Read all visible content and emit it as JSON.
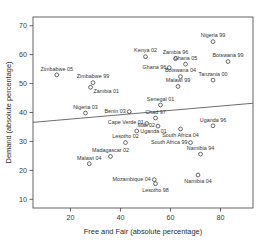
{
  "chart_data": {
    "type": "scatter",
    "title": "",
    "xlabel": "Free and Fair (absolute percentage)",
    "ylabel": "Demand (absolute percentage)",
    "xlim": [
      5,
      93
    ],
    "ylim": [
      7,
      73
    ],
    "xticks": [
      20,
      40,
      60,
      80
    ],
    "yticks": [
      10,
      20,
      30,
      40,
      50,
      60,
      70
    ],
    "grid": false,
    "legend": "none",
    "marker": "open-circle",
    "fit_line": {
      "label": "linear-fit",
      "x": [
        5,
        93
      ],
      "y": [
        36.6,
        43.2
      ]
    },
    "points": [
      {
        "label": "Zimbabwe 05",
        "x": 14.5,
        "y": 53.0,
        "lpos": "above"
      },
      {
        "label": "Zimbabwe 99",
        "x": 29.0,
        "y": 50.3,
        "lpos": "above"
      },
      {
        "label": "Zambia 01",
        "x": 28.0,
        "y": 48.7,
        "lpos": "below-right"
      },
      {
        "label": "Kenya 02",
        "x": 50.0,
        "y": 59.3,
        "lpos": "above"
      },
      {
        "label": "Zambia 96",
        "x": 62.0,
        "y": 58.6,
        "lpos": "above"
      },
      {
        "label": "Ghana 05",
        "x": 66.0,
        "y": 56.7,
        "lpos": "above"
      },
      {
        "label": "Nigeria 99",
        "x": 77.0,
        "y": 64.5,
        "lpos": "above"
      },
      {
        "label": "Botswana 99",
        "x": 83.0,
        "y": 57.6,
        "lpos": "above"
      },
      {
        "label": "Ghana 96",
        "x": 59.5,
        "y": 55.5,
        "lpos": "below-left"
      },
      {
        "label": "Botswana 04",
        "x": 64.0,
        "y": 52.4,
        "lpos": "above"
      },
      {
        "label": "Tanzania 00",
        "x": 77.0,
        "y": 51.2,
        "lpos": "above"
      },
      {
        "label": "Malawi 99",
        "x": 63.0,
        "y": 49.0,
        "lpos": "above"
      },
      {
        "label": "Senegal 01",
        "x": 56.0,
        "y": 42.6,
        "lpos": "above"
      },
      {
        "label": "Nigeria 03",
        "x": 26.0,
        "y": 39.8,
        "lpos": "above"
      },
      {
        "label": "Benin 03",
        "x": 43.5,
        "y": 40.3,
        "lpos": "left"
      },
      {
        "label": "Chad 97",
        "x": 54.0,
        "y": 38.1,
        "lpos": "above"
      },
      {
        "label": "Cape Verde 01",
        "x": 50.5,
        "y": 36.2,
        "lpos": "below-left"
      },
      {
        "label": "Mali 02",
        "x": 55.0,
        "y": 35.3,
        "lpos": "below-left"
      },
      {
        "label": "Uganda 96",
        "x": 77.0,
        "y": 35.4,
        "lpos": "above"
      },
      {
        "label": "Uganda 01",
        "x": 46.5,
        "y": 33.6,
        "lpos": "right"
      },
      {
        "label": "South Africa 04",
        "x": 64.0,
        "y": 34.3,
        "lpos": "below"
      },
      {
        "label": "South Africa 99",
        "x": 68.0,
        "y": 29.6,
        "lpos": "below-left"
      },
      {
        "label": "Lesotho 02",
        "x": 42.0,
        "y": 29.6,
        "lpos": "above"
      },
      {
        "label": "Namibia 94",
        "x": 72.0,
        "y": 25.6,
        "lpos": "above"
      },
      {
        "label": "Madagascar 02",
        "x": 36.0,
        "y": 24.8,
        "lpos": "above"
      },
      {
        "label": "Malawi 04",
        "x": 27.5,
        "y": 22.3,
        "lpos": "above"
      },
      {
        "label": "Namibia 04",
        "x": 71.0,
        "y": 18.4,
        "lpos": "below"
      },
      {
        "label": "Mozambique 04",
        "x": 53.5,
        "y": 16.8,
        "lpos": "left"
      },
      {
        "label": "Lesotho 98",
        "x": 54.0,
        "y": 15.4,
        "lpos": "below"
      }
    ]
  }
}
